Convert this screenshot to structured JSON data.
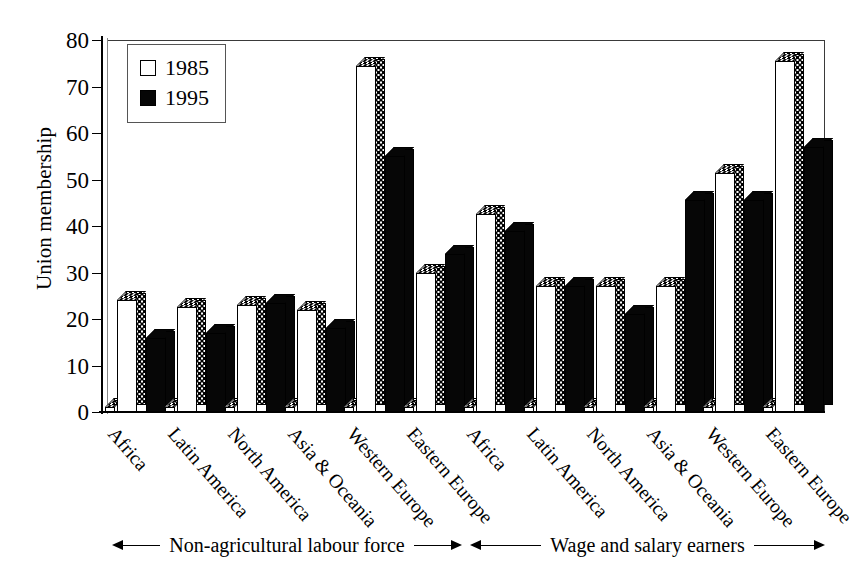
{
  "chart_data": {
    "type": "bar",
    "title": "",
    "xlabel": "",
    "ylabel": "Union membership",
    "ylim": [
      0,
      80
    ],
    "yticks": [
      0,
      10,
      20,
      30,
      40,
      50,
      60,
      70,
      80
    ],
    "grid": false,
    "legend_position": "top-left",
    "categories": [
      "Africa",
      "Latin America",
      "North America",
      "Asia & Oceania",
      "Western Europe",
      "Eastern Europe",
      "Africa",
      "Latin America",
      "North America",
      "Asia & Oceania",
      "Western Europe",
      "Eastern Europe"
    ],
    "series": [
      {
        "name": "1985",
        "values": [
          24,
          22.5,
          23,
          22,
          74.5,
          30,
          42.5,
          27,
          27,
          27,
          51.5,
          75.5
        ]
      },
      {
        "name": "1995",
        "values": [
          16,
          17,
          23.5,
          18,
          55,
          34,
          39,
          27,
          21,
          45.5,
          45.5,
          57
        ]
      }
    ],
    "groups": [
      {
        "label": "Non-agricultural labour force",
        "span": [
          0,
          5
        ]
      },
      {
        "label": "Wage and salary earners",
        "span": [
          6,
          11
        ]
      }
    ],
    "colors": {
      "1985": "#ffffff",
      "1995": "#060606",
      "axis": "#000000"
    }
  },
  "legend": {
    "entries": [
      {
        "label": "1985",
        "style": "white"
      },
      {
        "label": "1995",
        "style": "black"
      }
    ]
  },
  "annotations": {
    "left": "Non-agricultural labour force",
    "right": "Wage and salary earners"
  }
}
